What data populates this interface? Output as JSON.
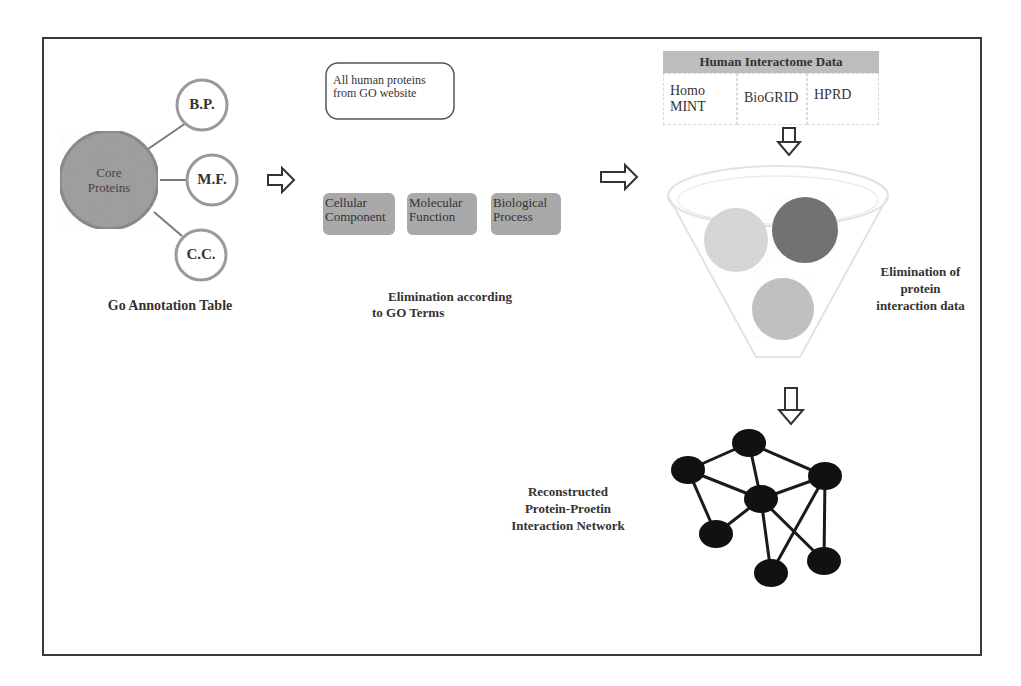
{
  "go_annotation": {
    "core_label": "Core Proteins",
    "satellites": [
      {
        "id": "bp",
        "label": "B.P."
      },
      {
        "id": "mf",
        "label": "M.F."
      },
      {
        "id": "cc",
        "label": "C.C."
      }
    ],
    "caption": "Go Annotation Table"
  },
  "go_terms": {
    "source_box": "All human proteins from GO website",
    "terms": [
      {
        "label": "Cellular Component"
      },
      {
        "label": "Molecular Function"
      },
      {
        "label": "Biological Process"
      }
    ],
    "caption_line1": "Elimination according",
    "caption_line2": "to GO Terms"
  },
  "interactome": {
    "title": "Human Interactome Data",
    "sources": [
      {
        "label": "Homo MINT"
      },
      {
        "label": "BioGRID"
      },
      {
        "label": "HPRD"
      }
    ],
    "funnel_caption_line1": "Elimination of",
    "funnel_caption_line2": "protein",
    "funnel_caption_line3": "interaction data",
    "ball_colors": [
      "#d9d9d9",
      "#7a7a7a",
      "#c4c4c4"
    ]
  },
  "network": {
    "caption_line1": "Reconstructed",
    "caption_line2": "Protein-Proetin",
    "caption_line3": "Interaction Network",
    "node_color": "#111111",
    "nodes": [
      {
        "id": "top",
        "x": 749,
        "y": 443
      },
      {
        "id": "left",
        "x": 688,
        "y": 470
      },
      {
        "id": "center",
        "x": 761,
        "y": 499
      },
      {
        "id": "right",
        "x": 825,
        "y": 476
      },
      {
        "id": "bottom-left",
        "x": 716,
        "y": 534
      },
      {
        "id": "bottom-center",
        "x": 771,
        "y": 573
      },
      {
        "id": "bottom-right",
        "x": 824,
        "y": 561
      }
    ],
    "edges": [
      [
        "top",
        "left"
      ],
      [
        "top",
        "center"
      ],
      [
        "top",
        "right"
      ],
      [
        "left",
        "center"
      ],
      [
        "left",
        "bottom-left"
      ],
      [
        "center",
        "right"
      ],
      [
        "center",
        "bottom-left"
      ],
      [
        "center",
        "bottom-center"
      ],
      [
        "center",
        "bottom-right"
      ],
      [
        "right",
        "bottom-center"
      ],
      [
        "right",
        "bottom-right"
      ]
    ]
  }
}
